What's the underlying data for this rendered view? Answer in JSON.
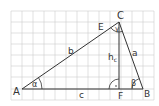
{
  "diagram": {
    "grid": {
      "x0": 11,
      "y0": 11,
      "x1": 154,
      "y1": 100,
      "step": 11,
      "color": "#cccccc"
    },
    "stroke_color": "#333333",
    "points": {
      "A": {
        "label": "A",
        "x": 22,
        "y": 89
      },
      "B": {
        "label": "B",
        "x": 143,
        "y": 89
      },
      "C": {
        "label": "C",
        "x": 119,
        "y": 22
      },
      "F": {
        "label": "F",
        "x": 119,
        "y": 89
      },
      "E": {
        "label": "E",
        "x": 109,
        "y": 28
      }
    },
    "sides": {
      "a": "a",
      "b": "b",
      "c": "c",
      "h": "h",
      "h_sub": "c"
    },
    "angles": {
      "alpha": "α",
      "beta": "β",
      "gamma": "γ"
    },
    "right_angle_dot": "·"
  }
}
